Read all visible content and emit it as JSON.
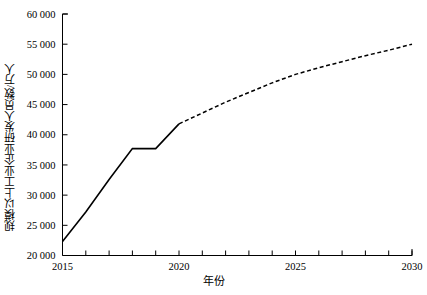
{
  "chart_data": {
    "type": "line",
    "title": "",
    "xlabel": "年份",
    "ylabel": "规模以上工业企业研发人员数/万人",
    "xlim": [
      2015,
      2030
    ],
    "ylim": [
      20000,
      60000
    ],
    "grid": false,
    "legend": "none",
    "x_ticks_major": [
      "2015",
      "2020",
      "2025",
      "2030"
    ],
    "x_ticks_major_values": [
      2015,
      2020,
      2025,
      2030
    ],
    "x_minor_tick_step": 1,
    "y_ticks": [
      "20 000",
      "25 000",
      "30 000",
      "35 000",
      "40 000",
      "45 000",
      "50 000",
      "55 000",
      "60 000"
    ],
    "y_tick_values": [
      20000,
      25000,
      30000,
      35000,
      40000,
      45000,
      50000,
      55000,
      60000
    ],
    "series": [
      {
        "name": "历史数据",
        "style": "solid",
        "color": "#000000",
        "x": [
          2015,
          2016,
          2017,
          2018,
          2019,
          2020
        ],
        "values": [
          22300,
          27200,
          32600,
          37700,
          37700,
          41800
        ]
      },
      {
        "name": "预测数据",
        "style": "dashed",
        "color": "#000000",
        "x": [
          2020,
          2021,
          2022,
          2023,
          2024,
          2025,
          2026,
          2027,
          2028,
          2029,
          2030
        ],
        "values": [
          41800,
          43600,
          45400,
          47000,
          48600,
          50000,
          51100,
          52100,
          53100,
          54000,
          55000
        ]
      }
    ],
    "annotations": []
  },
  "axes": {
    "y_axis_name": "y-axis",
    "x_axis_name": "x-axis"
  }
}
